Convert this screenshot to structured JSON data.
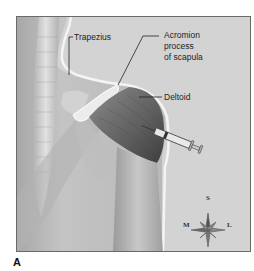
{
  "figure": {
    "panel_label": "A",
    "labels": {
      "trapezius": "Trapezius",
      "acromion_line1": "Acromion",
      "acromion_line2": "process",
      "acromion_line3": "of scapula",
      "deltoid": "Deltoid"
    },
    "compass": {
      "top": "S",
      "bottom": "I",
      "left": "M",
      "right": "L"
    },
    "colors": {
      "background": "#d3d3d3",
      "skin_light": "#e6e6e6",
      "muscle_dark": "#5e5e5e",
      "outline": "#ffffff"
    }
  }
}
